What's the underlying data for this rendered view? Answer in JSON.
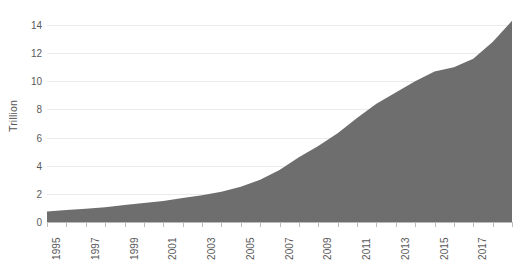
{
  "chart_data": {
    "type": "area",
    "title": "",
    "subtitle": "",
    "xlabel": "",
    "ylabel": "Trillion",
    "xlim": [
      1995,
      2019
    ],
    "ylim": [
      0,
      14.5
    ],
    "grid": true,
    "legend": "none",
    "fill_color": "#6e6e6e",
    "gridline_color": "#ebebeb",
    "axis_color": "#b9b9b9",
    "tick_label_color": "#5a5a5a",
    "y_ticks": [
      0,
      2,
      4,
      6,
      8,
      10,
      12,
      14
    ],
    "y_tick_labels": [
      "0",
      "2",
      "4",
      "6",
      "8",
      "10",
      "12",
      "14"
    ],
    "x_tick_labels": [
      "1995",
      "1997",
      "1999",
      "2001",
      "2003",
      "2005",
      "2007",
      "2009",
      "2011",
      "2013",
      "2015",
      "2017",
      "2019"
    ],
    "x_tick_label_rotation": -90,
    "x": [
      1995,
      1996,
      1997,
      1998,
      1999,
      2000,
      2001,
      2002,
      2003,
      2004,
      2005,
      2006,
      2007,
      2008,
      2009,
      2010,
      2011,
      2012,
      2013,
      2014,
      2015,
      2016,
      2017,
      2018,
      2019
    ],
    "categories": [
      "1995",
      "1996",
      "1997",
      "1998",
      "1999",
      "2000",
      "2001",
      "2002",
      "2003",
      "2004",
      "2005",
      "2006",
      "2007",
      "2008",
      "2009",
      "2010",
      "2011",
      "2012",
      "2013",
      "2014",
      "2015",
      "2016",
      "2017",
      "2018",
      "2019"
    ],
    "values": [
      0.75,
      0.85,
      0.95,
      1.05,
      1.2,
      1.35,
      1.5,
      1.7,
      1.9,
      2.15,
      2.5,
      3.0,
      3.7,
      4.6,
      5.4,
      6.3,
      7.4,
      8.4,
      9.2,
      10.0,
      10.7,
      11.0,
      11.6,
      12.8,
      14.3
    ],
    "series": [
      {
        "name": "Trillion",
        "values": [
          0.75,
          0.85,
          0.95,
          1.05,
          1.2,
          1.35,
          1.5,
          1.7,
          1.9,
          2.15,
          2.5,
          3.0,
          3.7,
          4.6,
          5.4,
          6.3,
          7.4,
          8.4,
          9.2,
          10.0,
          10.7,
          11.0,
          11.6,
          12.8,
          14.3
        ]
      }
    ]
  }
}
